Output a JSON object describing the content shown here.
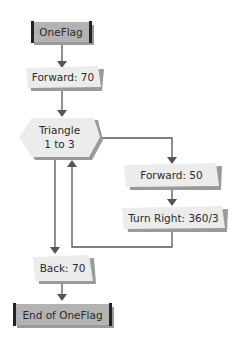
{
  "diagram": {
    "type": "flowchart",
    "nodes": {
      "start": {
        "label": "OneFlag",
        "shape": "terminal"
      },
      "forward70": {
        "label": "Forward: 70",
        "shape": "process"
      },
      "loop": {
        "label_line1": "Triangle",
        "label_line2": "1 to 3",
        "shape": "loop-hexagon"
      },
      "forward50": {
        "label": "Forward: 50",
        "shape": "process"
      },
      "turn": {
        "label": "Turn Right: 360/3",
        "shape": "process"
      },
      "back70": {
        "label": "Back: 70",
        "shape": "process"
      },
      "end": {
        "label": "End of OneFlag",
        "shape": "terminal"
      }
    },
    "colors": {
      "terminal_fill": "#b3b3b3",
      "process_fill": "#ececec",
      "shadow": "#9a9a9a",
      "line": "#555555"
    }
  }
}
